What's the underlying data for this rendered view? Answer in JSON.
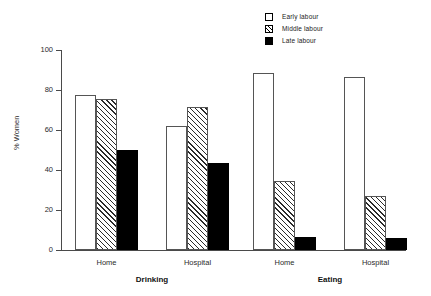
{
  "chart_data": {
    "type": "bar",
    "title": "",
    "xlabel": "",
    "ylabel": "% Women",
    "ylim": [
      0,
      100
    ],
    "yticks": [
      0,
      20,
      40,
      60,
      80,
      100
    ],
    "grid": false,
    "legend_position": "top-right",
    "panels": [
      {
        "name": "Drinking",
        "categories": [
          "Home",
          "Hospital"
        ]
      },
      {
        "name": "Eating",
        "categories": [
          "Home",
          "Hospital"
        ]
      }
    ],
    "categories": [
      "Drinking - Home",
      "Drinking - Hospital",
      "Eating - Home",
      "Eating - Hospital"
    ],
    "series": [
      {
        "name": "Early labour",
        "fill": "white",
        "values": [
          77.5,
          62.0,
          88.5,
          86.5
        ]
      },
      {
        "name": "Middle labour",
        "fill": "hatched",
        "values": [
          75.5,
          71.5,
          34.5,
          27.0
        ]
      },
      {
        "name": "Late labour",
        "fill": "black",
        "values": [
          50.0,
          43.5,
          6.5,
          6.0
        ]
      }
    ]
  },
  "legend": {
    "items": [
      {
        "label": "Early labour",
        "swatch": "open-square-icon"
      },
      {
        "label": "Middle labour",
        "swatch": "hatched-square-icon"
      },
      {
        "label": "Late labour",
        "swatch": "filled-square-icon"
      }
    ]
  },
  "axes": {
    "y_title": "% Women",
    "y_tick_labels": [
      "0",
      "20",
      "40",
      "60",
      "80",
      "100"
    ],
    "group_labels": [
      "Home",
      "Hospital",
      "Home",
      "Hospital"
    ],
    "panel_labels": [
      "Drinking",
      "Eating"
    ]
  },
  "colors": {
    "bar_outline": "#555555",
    "late_fill": "#000000",
    "axis": "#4a4a4a",
    "background": "#ffffff",
    "text": "#2b2b2b"
  }
}
